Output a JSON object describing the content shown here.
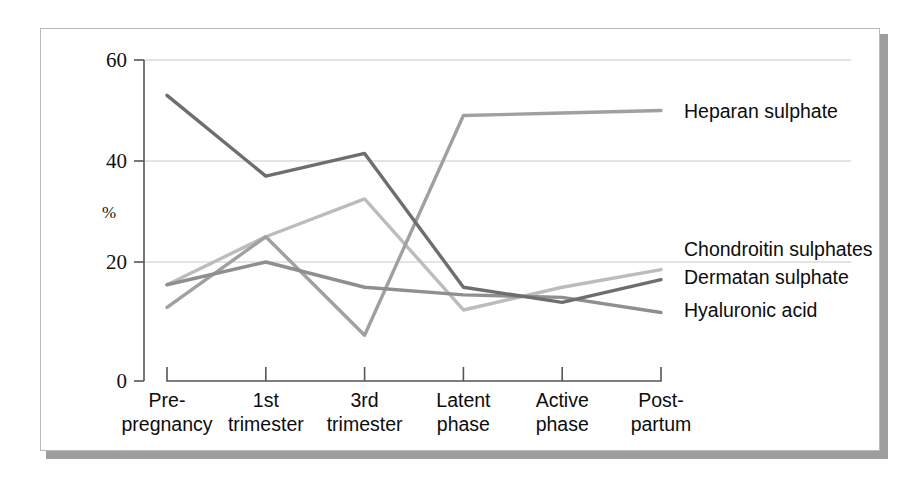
{
  "figure": {
    "frame_color": "#b9b9b9",
    "shadow_color": "#9e9e9e",
    "background": "#ffffff"
  },
  "axes": {
    "y_unit_label": "%",
    "y_ticks": [
      "0",
      "20",
      "40",
      "60"
    ],
    "y_tick_values": [
      0,
      20,
      40,
      60
    ],
    "y_min": 0,
    "y_max": 60,
    "x_categories_line1": [
      "Pre-",
      "1st",
      "3rd",
      "Latent",
      "Active",
      "Post-"
    ],
    "x_categories_line2": [
      "pregnancy",
      "trimester",
      "trimester",
      "phase",
      "phase",
      "partum"
    ]
  },
  "series_labels": {
    "heparan": "Heparan sulphate",
    "chondroitin": "Chondroitin sulphates",
    "dermatan": "Dermatan sulphate",
    "hyaluronic": "Hyaluronic acid"
  },
  "chart_data": {
    "type": "line",
    "title": "",
    "xlabel": "",
    "ylabel": "%",
    "ylim": [
      0,
      60
    ],
    "grid": true,
    "legend_position": "right-inline",
    "categories": [
      "Pre-pregnancy",
      "1st trimester",
      "3rd trimester",
      "Latent phase",
      "Active phase",
      "Post-partum"
    ],
    "series": [
      {
        "name": "Heparan sulphate",
        "color": "#6e6e6e",
        "values": [
          53,
          37,
          41.5,
          15,
          12,
          16.5
        ]
      },
      {
        "name": "Chondroitin sulphates",
        "color": "#a0a0a0",
        "values": [
          11,
          25,
          5.5,
          49,
          49.5,
          50
        ]
      },
      {
        "name": "Dermatan sulphate",
        "color": "#bcbcbc",
        "values": [
          15.5,
          25,
          32.5,
          10.5,
          15,
          18.5
        ]
      },
      {
        "name": "Hyaluronic acid",
        "color": "#8f8f8f",
        "values": [
          15.5,
          20,
          15,
          13.5,
          13,
          10
        ]
      }
    ]
  }
}
